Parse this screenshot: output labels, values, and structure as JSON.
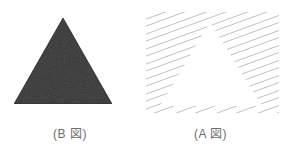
{
  "canvas": {
    "width": 281,
    "height": 163,
    "background_color": "#ffffff"
  },
  "figures": [
    {
      "id": "figure-b",
      "kind": "solid-filled-triangle",
      "caption": "(B 図)",
      "fill_color": "#2d2d2d",
      "texture": "slight-grain",
      "apex": {
        "x": 49,
        "y": 0
      },
      "base_left": {
        "x": 0,
        "y": 86
      },
      "base_right": {
        "x": 98,
        "y": 86
      }
    },
    {
      "id": "figure-a",
      "kind": "illusory-triangle-in-hatching",
      "caption": "(A 図)",
      "hatch_color": "#b8b8bc",
      "hatch_line_width": 0.9,
      "hatch_spacing": 7.5,
      "hatch_angle_deg": -20,
      "hatch_count": 22,
      "gap_shape": "triangle",
      "gap_apex": {
        "x": 64,
        "y": 10
      },
      "gap_base_left": {
        "x": 14,
        "y": 94
      },
      "gap_base_right": {
        "x": 116,
        "y": 94
      }
    }
  ],
  "captions": {
    "left_label": "(B 図)",
    "right_label": "(A 図)",
    "text_color": "#6e6e6e",
    "font_size_px": 12
  },
  "icon_names": {
    "solid_triangle": "filled-triangle-icon",
    "hatched_triangle": "hatched-illusory-triangle-icon"
  }
}
